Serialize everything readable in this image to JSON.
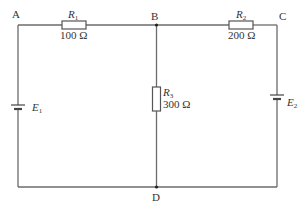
{
  "diagram": {
    "type": "circuit",
    "nodes": {
      "A": "A",
      "B": "B",
      "C": "C",
      "D": "D"
    },
    "resistors": [
      {
        "id": "R1",
        "symbol": "R",
        "subscript": "1",
        "value": "100 Ω",
        "between": "A-B"
      },
      {
        "id": "R2",
        "symbol": "R",
        "subscript": "2",
        "value": "200 Ω",
        "between": "B-C"
      },
      {
        "id": "R3",
        "symbol": "R",
        "subscript": "3",
        "value": "300 Ω",
        "between": "B-D"
      }
    ],
    "sources": [
      {
        "id": "E1",
        "symbol": "E",
        "subscript": "1",
        "branch": "left"
      },
      {
        "id": "E2",
        "symbol": "E",
        "subscript": "2",
        "branch": "right"
      }
    ],
    "colors": {
      "wire": "#6b6b6b",
      "text": "#333333",
      "background": "#ffffff"
    }
  }
}
